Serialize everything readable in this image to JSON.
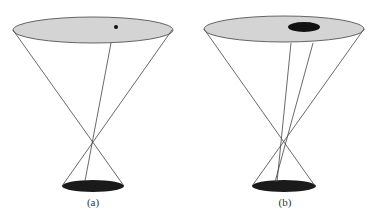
{
  "figure": {
    "colors": {
      "upper_disk_fill": "#d4d4d4",
      "upper_disk_stroke": "#555555",
      "lower_disk_fill": "#1a1a1a",
      "ray_stroke": "#444444",
      "spot_fill": "#111111"
    },
    "panels": [
      {
        "label": "(a)",
        "upper_disk": {
          "cx": 93,
          "cy": 30,
          "rx": 80,
          "ry": 13
        },
        "spot": {
          "type": "point",
          "cx": 116,
          "cy": 27,
          "r": 2
        },
        "lower_disk": {
          "cx": 93,
          "cy": 186,
          "rx": 31,
          "ry": 6
        },
        "rays": [
          {
            "x1": 13,
            "y1": 30,
            "x2": 124,
            "y2": 186
          },
          {
            "x1": 172,
            "y1": 30,
            "x2": 62,
            "y2": 186
          },
          {
            "x1": 111,
            "y1": 43,
            "x2": 85,
            "y2": 181
          }
        ],
        "label_x": 93
      },
      {
        "label": "(b)",
        "upper_disk": {
          "cx": 284,
          "cy": 29,
          "rx": 80,
          "ry": 13
        },
        "spot": {
          "type": "ellipse",
          "cx": 304,
          "cy": 27,
          "rx": 16,
          "ry": 5
        },
        "lower_disk": {
          "cx": 284,
          "cy": 186,
          "rx": 32,
          "ry": 6
        },
        "rays": [
          {
            "x1": 204,
            "y1": 29,
            "x2": 315,
            "y2": 186
          },
          {
            "x1": 364,
            "y1": 29,
            "x2": 252,
            "y2": 186
          },
          {
            "x1": 291,
            "y1": 43,
            "x2": 277,
            "y2": 182
          },
          {
            "x1": 313,
            "y1": 43,
            "x2": 275,
            "y2": 182
          }
        ],
        "label_x": 285
      }
    ]
  }
}
